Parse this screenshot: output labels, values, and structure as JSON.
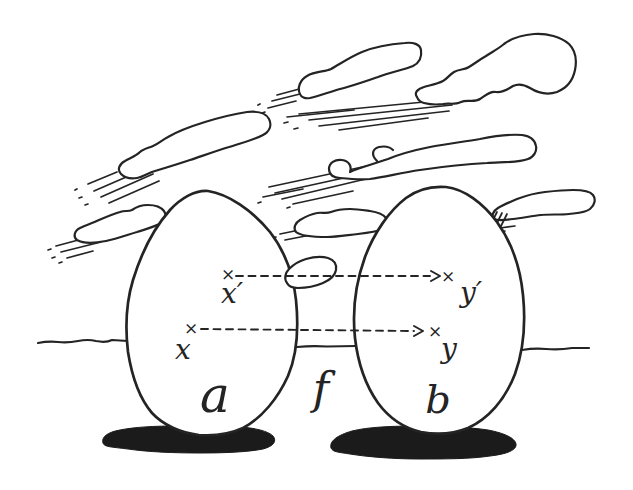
{
  "illustration": {
    "map": {
      "label": "f",
      "from": "a",
      "to": "b"
    },
    "sets": {
      "domain": {
        "label": "a"
      },
      "codomain": {
        "label": "b"
      }
    },
    "points": {
      "marker": "×",
      "x": {
        "label": "x",
        "maps_to": "y"
      },
      "x_prime": {
        "label": "x′",
        "maps_to": "y′"
      },
      "y": {
        "label": "y"
      },
      "y_prime": {
        "label": "y′"
      }
    },
    "colors": {
      "ink": "#242424",
      "background": "#ffffff",
      "shadow": "#1b1b1b"
    }
  }
}
